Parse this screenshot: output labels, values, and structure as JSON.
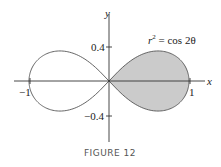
{
  "figure": {
    "caption": "FIGURE 12",
    "equation": {
      "r": "r",
      "exp": "2",
      "rest": " = cos 2θ"
    },
    "axes": {
      "x_label": "x",
      "y_label": "y",
      "x_ticks": [
        {
          "value": -1,
          "label": "−1"
        },
        {
          "value": 1,
          "label": "1"
        }
      ],
      "y_ticks": [
        {
          "value": 0.4,
          "label": "0.4"
        },
        {
          "value": -0.4,
          "label": "−0.4"
        }
      ]
    },
    "shaded_region": "right loop (−π/4 ≤ θ ≤ π/4)",
    "colors": {
      "shade": "#c8c8c8",
      "curve": "#555555",
      "axis": "#333333"
    }
  },
  "chart_data": {
    "type": "line",
    "curve": "lemniscate, polar r^2 = cos(2θ)",
    "xlabel": "x",
    "ylabel": "y",
    "xlim": [
      -1.2,
      1.2
    ],
    "ylim": [
      -0.8,
      0.8
    ],
    "x_ticks": [
      -1,
      1
    ],
    "y_ticks": [
      -0.4,
      0.4
    ],
    "shaded": "right loop",
    "grid": false
  }
}
